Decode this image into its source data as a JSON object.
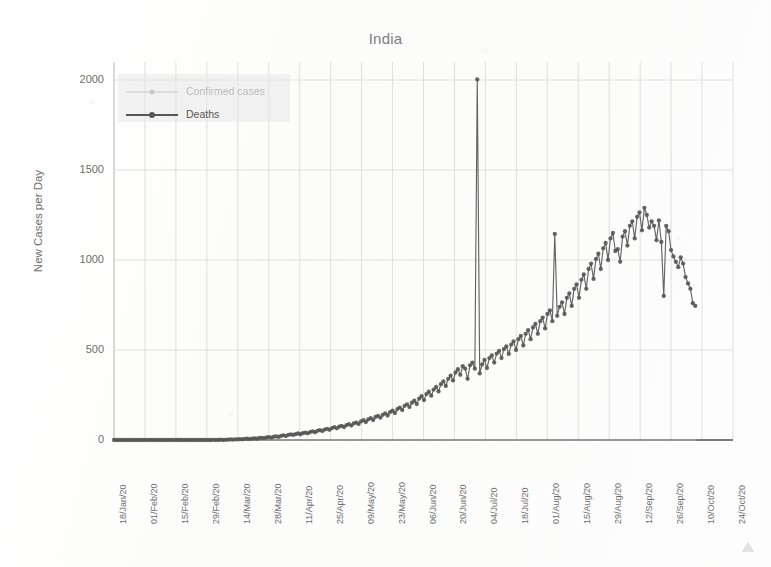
{
  "chart_data": {
    "type": "line",
    "title": "India",
    "xlabel": "",
    "ylabel": "New Cases per Day",
    "ylim": [
      0,
      2100
    ],
    "yticks": [
      0,
      500,
      1000,
      1500,
      2000
    ],
    "ytick_labels": [
      "0",
      "500",
      "1000",
      "1500",
      "2000"
    ],
    "grid": true,
    "legend_position": "upper-left-inside",
    "xtick_labels": [
      "18/Jan/20",
      "01/Feb/20",
      "15/Feb/20",
      "29/Feb/20",
      "14/Mar/20",
      "28/Mar/20",
      "11/Apr/20",
      "25/Apr/20",
      "09/May/20",
      "23/May/20",
      "06/Jun/20",
      "20/Jun/20",
      "04/Jul/20",
      "18/Jul/20",
      "01/Aug/20",
      "15/Aug/20",
      "29/Aug/20",
      "12/Sep/20",
      "26/Sep/20",
      "10/Oct/20",
      "24/Oct/20"
    ],
    "x_start_date": "18/Jan/20",
    "x_end_date": "24/Oct/20",
    "x_tick_interval_days": 14,
    "series": [
      {
        "name": "Confirmed cases",
        "color": "#c9c9c9",
        "marker": "circle",
        "note": "nearly flat near zero across the whole range",
        "values": [
          0,
          0,
          0,
          0,
          0,
          0,
          0,
          0,
          0,
          0,
          0,
          0,
          0,
          0,
          0,
          0,
          0,
          0,
          0,
          0,
          0,
          0,
          0,
          0,
          0,
          0,
          0,
          0,
          0,
          0,
          0,
          0,
          0,
          0,
          0,
          0,
          0,
          0,
          0,
          0,
          0,
          0,
          0,
          0,
          0,
          0,
          0,
          0,
          0,
          0,
          0,
          0,
          0,
          0,
          0,
          0,
          0,
          0,
          0,
          0,
          0,
          0,
          0,
          0,
          0,
          0,
          0,
          0,
          0,
          0,
          0,
          0,
          0,
          0,
          0,
          0,
          0,
          0,
          0,
          0,
          0,
          0,
          0,
          0,
          0,
          0,
          0,
          0,
          0,
          0,
          0,
          0,
          0,
          0,
          0,
          0,
          0,
          0,
          0,
          0,
          0,
          0,
          0,
          0,
          0,
          0,
          0,
          0,
          0,
          0,
          0,
          0,
          0,
          0,
          0,
          0,
          0,
          0,
          0,
          0,
          0,
          0,
          0,
          0,
          0,
          0,
          0,
          0,
          0,
          0,
          0,
          0,
          0,
          0,
          0,
          0,
          0,
          0,
          0,
          0,
          0,
          0,
          0,
          0,
          0,
          0,
          0,
          0,
          0,
          0,
          0,
          0,
          0,
          0,
          0,
          0,
          0,
          0,
          0,
          0,
          0,
          0,
          0,
          0,
          0,
          0,
          0,
          0,
          0,
          0,
          0,
          0,
          0,
          0,
          0,
          0,
          0,
          0,
          0,
          0,
          0,
          0,
          0,
          0,
          0,
          0,
          0,
          0,
          0,
          0,
          0,
          0,
          0,
          0,
          0,
          0,
          0,
          0,
          0,
          0,
          0,
          0,
          0,
          0,
          0,
          0,
          0,
          0,
          0,
          0,
          0,
          0,
          0,
          0,
          0,
          0,
          0,
          0,
          0,
          0,
          0,
          0,
          0,
          0,
          0,
          0,
          0,
          0,
          0,
          0,
          0,
          0,
          0,
          0,
          0,
          0,
          0,
          0,
          0,
          0,
          0,
          0,
          0,
          0,
          0,
          0,
          0,
          0,
          0,
          0,
          0,
          0,
          0,
          0,
          0,
          0,
          0,
          0,
          0,
          0,
          0,
          0,
          0,
          0,
          0,
          0,
          0,
          0,
          0,
          0
        ]
      },
      {
        "name": "Deaths",
        "color": "#575757",
        "marker": "circle",
        "peak_value": 2003,
        "peak_date": "16/Jun/20",
        "secondary_spike_value": 1145,
        "secondary_spike_date": "16/Jul/20",
        "max_sustained_value": 1290,
        "max_sustained_date": "16/Sep/20",
        "final_value": 745,
        "values": [
          0,
          0,
          0,
          0,
          0,
          0,
          0,
          0,
          0,
          0,
          0,
          0,
          0,
          0,
          0,
          0,
          0,
          0,
          0,
          0,
          0,
          0,
          0,
          0,
          0,
          0,
          0,
          0,
          0,
          0,
          0,
          0,
          0,
          0,
          0,
          0,
          0,
          0,
          0,
          0,
          0,
          1,
          0,
          0,
          2,
          0,
          1,
          2,
          3,
          2,
          4,
          3,
          5,
          4,
          6,
          7,
          5,
          8,
          9,
          7,
          11,
          12,
          10,
          14,
          16,
          13,
          18,
          20,
          17,
          23,
          26,
          22,
          29,
          31,
          28,
          33,
          36,
          32,
          38,
          41,
          37,
          44,
          48,
          43,
          51,
          55,
          50,
          58,
          62,
          57,
          66,
          71,
          65,
          74,
          79,
          72,
          83,
          88,
          80,
          92,
          97,
          89,
          103,
          110,
          100,
          115,
          122,
          111,
          128,
          134,
          124,
          140,
          148,
          136,
          155,
          163,
          150,
          172,
          180,
          166,
          190,
          198,
          183,
          207,
          218,
          200,
          230,
          243,
          222,
          255,
          268,
          246,
          280,
          295,
          270,
          310,
          326,
          300,
          340,
          358,
          330,
          375,
          393,
          362,
          410,
          397,
          340,
          415,
          430,
          396,
          2003,
          370,
          420,
          445,
          400,
          455,
          470,
          430,
          480,
          495,
          455,
          505,
          520,
          478,
          530,
          548,
          500,
          560,
          578,
          525,
          590,
          610,
          560,
          625,
          645,
          590,
          660,
          680,
          620,
          700,
          720,
          660,
          1145,
          690,
          740,
          765,
          700,
          790,
          815,
          745,
          840,
          865,
          790,
          890,
          920,
          840,
          950,
          980,
          895,
          1005,
          1035,
          950,
          1065,
          1095,
          1000,
          1120,
          1150,
          1050,
          1060,
          990,
          1130,
          1160,
          1080,
          1190,
          1215,
          1120,
          1240,
          1265,
          1165,
          1290,
          1250,
          1180,
          1215,
          1190,
          1110,
          1220,
          1100,
          800,
          1190,
          1160,
          1055,
          1020,
          990,
          960,
          1015,
          980,
          905,
          870,
          840,
          760,
          745
        ]
      }
    ]
  },
  "legend": {
    "items": [
      {
        "label": "Confirmed cases",
        "color": "#c9c9c9"
      },
      {
        "label": "Deaths",
        "color": "#575757"
      }
    ]
  }
}
